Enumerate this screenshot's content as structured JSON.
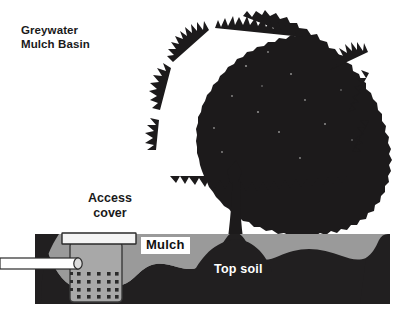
{
  "diagram": {
    "title_line1": "Greywater",
    "title_line2": "Mulch Basin",
    "labels": {
      "access_cover_line1": "Access",
      "access_cover_line2": "cover",
      "mulch": "Mulch",
      "top_soil": "Top soil"
    },
    "colors": {
      "background": "#ffffff",
      "soil_dark": "#211f20",
      "mulch_gray": "#9a9a9a",
      "basin_fill": "#a8a8a8",
      "basin_stroke": "#3a3a3a",
      "pipe_fill": "#ffffff",
      "cover_fill": "#f4f4f4",
      "text_dark": "#1a1a1a",
      "text_light": "#ffffff"
    },
    "elements": {
      "tree_canopy": "tree-canopy-silhouette",
      "tree_trunk": "tree-trunk",
      "basin": "perforated-mulch-basin",
      "basin_holes_cols": 5,
      "basin_holes_rows": 4,
      "inlet_pipe": "greywater-inlet-pipe",
      "access_cover": "access-cover-plate"
    }
  }
}
